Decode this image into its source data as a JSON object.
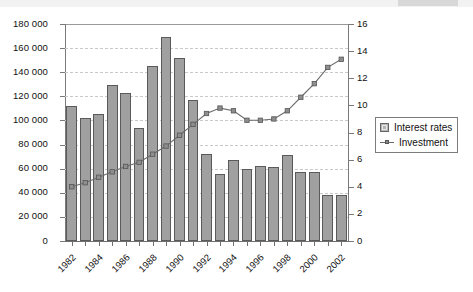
{
  "chart_data": {
    "type": "bar",
    "title": "",
    "subtitle": "",
    "xlabel": "",
    "ylabel": "",
    "y2label": "",
    "grid": true,
    "legend_position": "right",
    "categories": [
      "1982",
      "1983",
      "1984",
      "1985",
      "1986",
      "1987",
      "1988",
      "1989",
      "1990",
      "1991",
      "1992",
      "1993",
      "1994",
      "1995",
      "1996",
      "1997",
      "1998",
      "1999",
      "2000",
      "2001",
      "2002"
    ],
    "x_tick_labels": [
      "1982",
      "1984",
      "1986",
      "1988",
      "1990",
      "1992",
      "1994",
      "1996",
      "1998",
      "2000",
      "2002"
    ],
    "y_tick_labels": [
      "0",
      "20 000",
      "40 000",
      "60 000",
      "80 000",
      "100 000",
      "120 000",
      "140 000",
      "160 000",
      "180 000"
    ],
    "y2_tick_labels": [
      "0",
      "2",
      "4",
      "6",
      "8",
      "10",
      "12",
      "14",
      "16"
    ],
    "ylim": [
      0,
      180000
    ],
    "y2lim": [
      0,
      16
    ],
    "y_tick_step": 20000,
    "y2_tick_step": 2,
    "series": [
      {
        "name": "Interest rates",
        "axis": "left",
        "type": "bar",
        "color": "#a0a0a0",
        "values": [
          112000,
          102000,
          105000,
          129000,
          123000,
          94000,
          145000,
          169000,
          152000,
          117000,
          72000,
          56000,
          67000,
          60000,
          62000,
          61000,
          71000,
          57000,
          57000,
          38000,
          38000
        ]
      },
      {
        "name": "Investment",
        "axis": "right",
        "type": "line",
        "color": "#6b6b6b",
        "values": [
          4.0,
          4.3,
          4.7,
          5.1,
          5.5,
          5.8,
          6.4,
          7.0,
          7.8,
          8.6,
          9.4,
          9.8,
          9.6,
          8.9,
          8.9,
          9.0,
          9.6,
          10.6,
          11.6,
          12.8,
          13.4
        ]
      }
    ]
  },
  "legend": {
    "items": [
      {
        "label": "Interest rates",
        "marker": "bar-swatch"
      },
      {
        "label": "Investment",
        "marker": "line-marker-swatch"
      }
    ]
  }
}
